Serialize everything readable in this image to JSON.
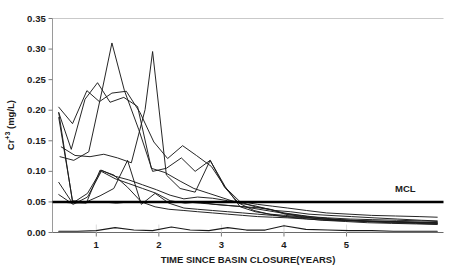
{
  "chart_data": {
    "type": "line",
    "title": "",
    "xlabel": "TIME SINCE BASIN CLOSURE(YEARS)",
    "ylabel": "Cr+3 (mg/L)",
    "ylabel_base": "Cr",
    "ylabel_sup": "+3",
    "ylabel_unit": " (mg/L)",
    "xlim": [
      0.3,
      6.55
    ],
    "ylim": [
      0.0,
      0.35
    ],
    "yticks": [
      0.0,
      0.05,
      0.1,
      0.15,
      0.2,
      0.25,
      0.3,
      0.35
    ],
    "ytick_labels": [
      "0.00",
      "0.05",
      "0.10",
      "0.15",
      "0.20",
      "0.25",
      "0.30",
      "0.35"
    ],
    "xticks": [
      1,
      2,
      3,
      4,
      5
    ],
    "xtick_labels": [
      "1",
      "2",
      "3",
      "4",
      "5"
    ],
    "grid": false,
    "legend": "none",
    "line_color": "#1a1a1a",
    "annotations": [
      {
        "name": "mcl-label",
        "text": "MCL",
        "x": 6.0,
        "y": 0.062
      }
    ],
    "reference_lines": [
      {
        "name": "mcl-line",
        "label": "MCL",
        "y": 0.05,
        "x_start": 0.3,
        "x_end": 6.55,
        "width": 2.6,
        "color": "#000000"
      }
    ],
    "series": [
      {
        "name": "Well 1",
        "x": [
          0.4,
          0.62,
          0.85,
          1.05,
          1.25,
          1.48,
          1.7,
          1.92,
          2.14,
          2.38,
          2.6,
          2.84,
          3.06,
          3.3,
          3.54,
          3.78,
          4.02,
          4.3,
          4.6,
          4.95,
          5.3,
          5.7,
          6.1,
          6.45
        ],
        "values": [
          0.205,
          0.178,
          0.232,
          0.214,
          0.228,
          0.231,
          0.196,
          0.148,
          0.121,
          0.142,
          0.126,
          0.108,
          0.074,
          0.05,
          0.042,
          0.038,
          0.03,
          0.026,
          0.022,
          0.02,
          0.018,
          0.016,
          0.015,
          0.014
        ]
      },
      {
        "name": "Well 2",
        "x": [
          0.4,
          0.6,
          0.82,
          1.02,
          1.22,
          1.44,
          1.66,
          1.88,
          2.1,
          2.34,
          2.56,
          2.8,
          3.04,
          3.28,
          3.52,
          3.76,
          4.0,
          4.28,
          4.58,
          4.92,
          5.28,
          5.68,
          6.08,
          6.45
        ],
        "values": [
          0.196,
          0.136,
          0.218,
          0.245,
          0.213,
          0.221,
          0.206,
          0.105,
          0.098,
          0.084,
          0.072,
          0.064,
          0.056,
          0.048,
          0.044,
          0.038,
          0.032,
          0.028,
          0.024,
          0.021,
          0.019,
          0.018,
          0.017,
          0.016
        ]
      },
      {
        "name": "Well 3",
        "x": [
          0.42,
          0.64,
          0.88,
          1.1,
          1.25,
          1.45,
          1.68,
          1.9,
          2.12,
          2.36,
          2.58,
          2.82,
          3.05,
          3.28,
          3.52,
          3.76,
          4.0,
          4.3,
          4.62,
          4.98,
          5.34,
          5.72,
          6.12,
          6.45
        ],
        "values": [
          0.124,
          0.118,
          0.132,
          0.236,
          0.31,
          0.232,
          0.168,
          0.1,
          0.105,
          0.122,
          0.1,
          0.118,
          0.074,
          0.048,
          0.036,
          0.03,
          0.026,
          0.023,
          0.02,
          0.018,
          0.016,
          0.015,
          0.014,
          0.013
        ]
      },
      {
        "name": "Well 4",
        "x": [
          0.44,
          0.66,
          0.9,
          1.12,
          1.34,
          1.56,
          1.78,
          1.9,
          2.12,
          2.34,
          2.58,
          2.82,
          3.06,
          3.3,
          3.54,
          3.78,
          4.02,
          4.32,
          4.64,
          5.0,
          5.36,
          5.74,
          6.14,
          6.45
        ],
        "values": [
          0.14,
          0.126,
          0.124,
          0.128,
          0.122,
          0.114,
          0.201,
          0.296,
          0.094,
          0.072,
          0.066,
          0.118,
          0.075,
          0.042,
          0.034,
          0.03,
          0.028,
          0.025,
          0.022,
          0.02,
          0.019,
          0.018,
          0.017,
          0.016
        ]
      },
      {
        "name": "Well 5",
        "x": [
          0.4,
          0.62,
          0.86,
          1.08,
          1.3,
          1.52,
          1.74,
          1.96,
          2.18,
          2.4,
          2.62,
          2.86,
          3.1,
          3.34,
          3.58,
          3.82,
          4.06,
          4.36,
          4.68,
          5.04,
          5.4,
          5.78,
          6.16,
          6.45
        ],
        "values": [
          0.082,
          0.048,
          0.064,
          0.102,
          0.092,
          0.086,
          0.078,
          0.07,
          0.061,
          0.055,
          0.058,
          0.056,
          0.052,
          0.05,
          0.046,
          0.043,
          0.04,
          0.036,
          0.032,
          0.03,
          0.028,
          0.027,
          0.026,
          0.025
        ]
      },
      {
        "name": "Well 6",
        "x": [
          0.4,
          0.63,
          0.86,
          1.08,
          1.3,
          1.52,
          1.74,
          1.96,
          2.18,
          2.42,
          2.64,
          2.88,
          3.12,
          3.36,
          3.6,
          3.84,
          4.08,
          4.38,
          4.7,
          5.06,
          5.42,
          5.8,
          6.18,
          6.45
        ],
        "values": [
          0.062,
          0.046,
          0.058,
          0.1,
          0.088,
          0.08,
          0.072,
          0.064,
          0.052,
          0.048,
          0.05,
          0.046,
          0.044,
          0.042,
          0.038,
          0.034,
          0.03,
          0.026,
          0.024,
          0.022,
          0.021,
          0.02,
          0.019,
          0.018
        ]
      },
      {
        "name": "Well 7",
        "x": [
          0.42,
          0.64,
          0.88,
          1.1,
          1.32,
          1.54,
          1.76,
          1.98,
          2.2,
          2.44,
          2.66,
          2.9,
          3.14,
          3.38,
          3.62,
          3.86,
          4.1,
          4.4,
          4.72,
          5.08,
          5.44,
          5.82,
          6.2,
          6.45
        ],
        "values": [
          0.05,
          0.048,
          0.049,
          0.05,
          0.048,
          0.05,
          0.049,
          0.05,
          0.049,
          0.05,
          0.048,
          0.046,
          0.044,
          0.042,
          0.04,
          0.036,
          0.034,
          0.03,
          0.028,
          0.026,
          0.024,
          0.022,
          0.02,
          0.019
        ]
      },
      {
        "name": "Well 8",
        "x": [
          0.4,
          0.62,
          0.84,
          1.06,
          1.28,
          1.5,
          1.72,
          1.94,
          2.16,
          2.4,
          2.62,
          2.86,
          3.1,
          3.34,
          3.58,
          3.82,
          4.06,
          4.36,
          4.68,
          5.04,
          5.4,
          5.78,
          6.16,
          6.45
        ],
        "values": [
          0.188,
          0.052,
          0.05,
          0.06,
          0.072,
          0.118,
          0.046,
          0.064,
          0.048,
          0.04,
          0.038,
          0.036,
          0.034,
          0.032,
          0.03,
          0.028,
          0.026,
          0.024,
          0.022,
          0.02,
          0.018,
          0.017,
          0.016,
          0.015
        ]
      },
      {
        "name": "Well 9",
        "x": [
          0.4,
          0.62,
          0.84,
          1.06,
          1.28,
          1.5,
          1.72,
          1.94,
          2.16,
          2.4,
          2.62,
          2.86,
          3.1,
          3.34,
          3.58,
          3.82,
          4.06,
          4.36,
          4.68,
          5.04,
          5.4,
          5.78,
          6.16,
          6.45
        ],
        "values": [
          0.196,
          0.05,
          0.048,
          0.102,
          0.094,
          0.074,
          0.05,
          0.042,
          0.038,
          0.036,
          0.034,
          0.032,
          0.03,
          0.028,
          0.026,
          0.025,
          0.024,
          0.022,
          0.02,
          0.019,
          0.018,
          0.017,
          0.016,
          0.015
        ]
      },
      {
        "name": "Well 10",
        "x": [
          0.4,
          0.7,
          1.0,
          1.3,
          1.6,
          1.9,
          2.2,
          2.5,
          2.8,
          3.1,
          3.4,
          3.7,
          4.0,
          4.35,
          4.7,
          5.05,
          5.4,
          5.75,
          6.1,
          6.45
        ],
        "values": [
          0.002,
          0.002,
          0.003,
          0.008,
          0.004,
          0.003,
          0.009,
          0.004,
          0.003,
          0.008,
          0.004,
          0.004,
          0.011,
          0.005,
          0.004,
          0.003,
          0.003,
          0.002,
          0.002,
          0.002
        ]
      }
    ]
  }
}
